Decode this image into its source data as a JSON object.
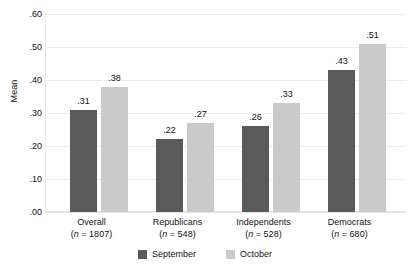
{
  "chart_data": {
    "type": "bar",
    "title": "",
    "subtitle": "",
    "xlabel": "",
    "ylabel": "Mean",
    "ylim": [
      0.0,
      0.6
    ],
    "ytick_labels": [
      ".60",
      ".50",
      ".40",
      ".30",
      ".20",
      ".10",
      ".00"
    ],
    "ytick_values": [
      0.6,
      0.5,
      0.4,
      0.3,
      0.2,
      0.1,
      0.0
    ],
    "grid": true,
    "legend_position": "bottom-center",
    "categories": [
      "Overall",
      "Republicans",
      "Independents",
      "Democrats"
    ],
    "category_counts": [
      "1807",
      "548",
      "528",
      "680"
    ],
    "series": [
      {
        "name": "September",
        "color": "#5a5a5a",
        "values": [
          0.31,
          0.22,
          0.26,
          0.43
        ],
        "labels": [
          ".31",
          ".22",
          ".26",
          ".43"
        ]
      },
      {
        "name": "October",
        "color": "#cacaca",
        "values": [
          0.38,
          0.27,
          0.33,
          0.51
        ],
        "labels": [
          ".38",
          ".27",
          ".33",
          ".51"
        ]
      }
    ]
  },
  "axis": {
    "y_title": "Mean",
    "ticks": [
      {
        "label": ".60",
        "value": 0.6
      },
      {
        "label": ".50",
        "value": 0.5
      },
      {
        "label": ".40",
        "value": 0.4
      },
      {
        "label": ".30",
        "value": 0.3
      },
      {
        "label": ".20",
        "value": 0.2
      },
      {
        "label": ".10",
        "value": 0.1
      },
      {
        "label": ".00",
        "value": 0.0
      }
    ]
  },
  "groups": [
    {
      "name": "Overall",
      "n_prefix": "(",
      "n_label_italic": "n",
      "n_label_rest": " = 1807)",
      "bars": [
        {
          "series": "September",
          "label": ".31",
          "value": 0.31
        },
        {
          "series": "October",
          "label": ".38",
          "value": 0.38
        }
      ]
    },
    {
      "name": "Republicans",
      "n_prefix": "(",
      "n_label_italic": "n",
      "n_label_rest": " = 548)",
      "bars": [
        {
          "series": "September",
          "label": ".22",
          "value": 0.22
        },
        {
          "series": "October",
          "label": ".27",
          "value": 0.27
        }
      ]
    },
    {
      "name": "Independents",
      "n_prefix": "(",
      "n_label_italic": "n",
      "n_label_rest": " = 528)",
      "bars": [
        {
          "series": "September",
          "label": ".26",
          "value": 0.26
        },
        {
          "series": "October",
          "label": ".33",
          "value": 0.33
        }
      ]
    },
    {
      "name": "Democrats",
      "n_prefix": "(",
      "n_label_italic": "n",
      "n_label_rest": " = 680)",
      "bars": [
        {
          "series": "September",
          "label": ".43",
          "value": 0.43
        },
        {
          "series": "October",
          "label": ".51",
          "value": 0.51
        }
      ]
    }
  ],
  "legend": {
    "items": [
      {
        "label": "September",
        "color": "#5a5a5a"
      },
      {
        "label": "October",
        "color": "#cacaca"
      }
    ]
  },
  "colors": {
    "september": "#5a5a5a",
    "october": "#cacaca",
    "gridline": "#ededed",
    "text": "#111111",
    "background": "#ffffff"
  }
}
